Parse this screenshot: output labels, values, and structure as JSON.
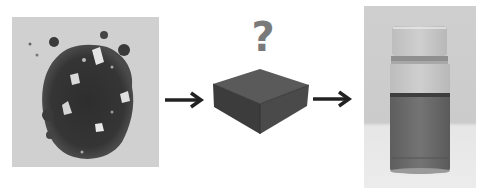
{
  "diagram": {
    "type": "process-flow",
    "steps": [
      {
        "id": "input",
        "label": "dark crystalline powder (photo)"
      },
      {
        "id": "process",
        "label": "unknown process (black box)",
        "symbol": "?"
      },
      {
        "id": "output",
        "label": "vial of liquid dispersion (photo)"
      }
    ],
    "connectors": [
      "arrow-right",
      "arrow-right"
    ]
  },
  "question_mark": "?",
  "colors": {
    "background": "#ffffff",
    "arrow": "#222222",
    "box_top": "#5a5a5a",
    "box_left": "#3c3c3c",
    "box_right": "#4a4a4a",
    "question_mark": "#7a7a7a",
    "photo_bg": "#d2d2d2",
    "liquid": "#6e6e6e"
  }
}
